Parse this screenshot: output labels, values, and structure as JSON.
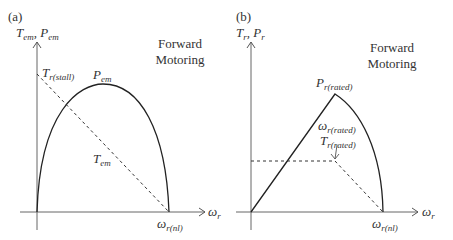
{
  "panels": [
    {
      "tag": "(a)",
      "y_axis_label": {
        "T": "T",
        "T_sub": "em",
        "sep": ", ",
        "P": "P",
        "P_sub": "em"
      },
      "x_axis_label": {
        "main": "ω",
        "sub": "r"
      },
      "note_line1": "Forward",
      "note_line2": "Motoring",
      "labels": {
        "stall": {
          "main": "T",
          "sub": "r(stall)"
        },
        "power": {
          "main": "P",
          "sub": "em"
        },
        "torque": {
          "main": "T",
          "sub": "em"
        },
        "noload": {
          "main": "ω",
          "sub": "r(nl)"
        }
      }
    },
    {
      "tag": "(b)",
      "y_axis_label": {
        "T": "T",
        "T_sub": "r",
        "sep": ", ",
        "P": "P",
        "P_sub": "r"
      },
      "x_axis_label": {
        "main": "ω",
        "sub": "r"
      },
      "note_line1": "Forward",
      "note_line2": "Motoring",
      "labels": {
        "rated_power": {
          "main": "P",
          "sub": "r(rated)"
        },
        "rated_speed": {
          "main": "ω",
          "sub": "r(rated)"
        },
        "rated_torque": {
          "main": "T",
          "sub": "r(rated)"
        },
        "noload": {
          "main": "ω",
          "sub": "r(nl)"
        }
      }
    }
  ]
}
